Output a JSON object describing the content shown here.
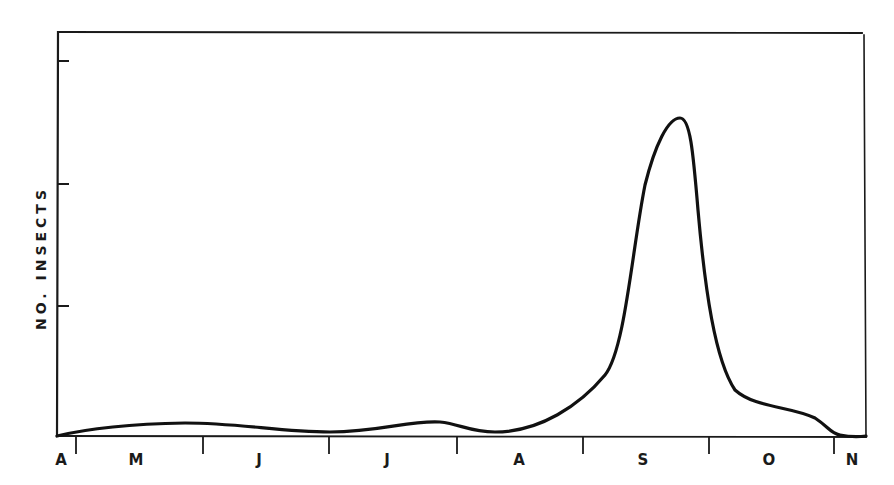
{
  "chart_data": {
    "type": "line",
    "title": "",
    "xlabel": "",
    "ylabel": "NO. INSECTS",
    "x_tick_labels": [
      "A",
      "M",
      "J",
      "J",
      "A",
      "S",
      "O",
      "N"
    ],
    "x_tick_label_positions_px": [
      61,
      136,
      259,
      387,
      519,
      643,
      769,
      852
    ],
    "x_tick_positions_px": [
      76,
      203,
      329,
      457,
      583,
      709,
      834
    ],
    "y_tick_positions_px": [
      61,
      184,
      306
    ],
    "y_tick_labels": [],
    "ylim_relative": [
      0,
      1.2
    ],
    "grid": false,
    "legend": "none",
    "series": [
      {
        "name": "No. insects",
        "description": "Seasonal abundance curve: low from April through August with minor humps in May and July, sharp peak in mid-September, decline through October to near zero in November",
        "x": [
          "Apr end",
          "May mid",
          "Jun end",
          "Jul end",
          "Aug mid",
          "Sep early",
          "Sep mid (peak)",
          "Sep end",
          "Oct mid",
          "Oct end",
          "Nov"
        ],
        "values_relative": [
          0.0,
          0.04,
          0.01,
          0.04,
          0.01,
          0.15,
          1.0,
          0.3,
          0.08,
          0.03,
          0.0
        ]
      }
    ],
    "frame": {
      "left": 57,
      "top": 32,
      "right": 866,
      "bottom": 436
    },
    "curve_path": "M 57 436 C 90 428, 130 424, 185 423 C 240 423, 280 432, 330 432 C 380 432, 410 420, 440 422 C 460 424, 470 432, 495 432 C 540 432, 580 405, 605 375 C 625 350, 632 250, 645 185 C 655 145, 668 118, 680 118 C 690 118, 693 150, 698 210 C 705 290, 715 360, 735 390 C 755 408, 790 406, 815 418 C 830 428, 830 433, 840 435 C 850 437, 858 437, 866 436"
  }
}
